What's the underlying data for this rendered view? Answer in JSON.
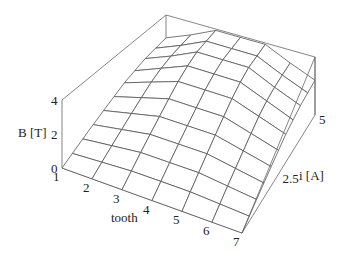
{
  "chart_data": {
    "type": "surface3d",
    "title": "",
    "xlabel": "tooth",
    "ylabel": "i [A]",
    "zlabel": "B [T]",
    "x_ticks": [
      "1",
      "2",
      "3",
      "4",
      "5",
      "6",
      "7"
    ],
    "y_ticks": [
      "2.5",
      "5"
    ],
    "z_ticks": [
      "0",
      "2",
      "4"
    ],
    "xlim": [
      1,
      7
    ],
    "ylim": [
      0,
      5
    ],
    "zlim": [
      0,
      4
    ],
    "x": [
      1,
      2,
      3,
      4,
      5,
      6,
      7
    ],
    "y": [
      0,
      0.5,
      1,
      1.5,
      2,
      2.5,
      3,
      3.5,
      4,
      4.5,
      5
    ],
    "z": [
      [
        0.0,
        0.3,
        0.6,
        0.9,
        1.2,
        1.5,
        1.8,
        2.0,
        2.2,
        2.3,
        2.4
      ],
      [
        0.0,
        0.4,
        0.8,
        1.2,
        1.6,
        2.0,
        2.4,
        2.7,
        2.9,
        3.0,
        3.1
      ],
      [
        0.0,
        0.5,
        1.0,
        1.5,
        2.0,
        2.5,
        3.0,
        3.4,
        3.7,
        3.8,
        3.9
      ],
      [
        0.0,
        0.5,
        1.0,
        1.5,
        2.0,
        2.5,
        3.0,
        3.4,
        3.7,
        3.8,
        3.9
      ],
      [
        0.0,
        0.5,
        1.0,
        1.5,
        2.0,
        2.5,
        3.0,
        3.4,
        3.7,
        3.8,
        3.9
      ],
      [
        0.0,
        0.4,
        0.8,
        1.2,
        1.6,
        2.0,
        2.4,
        2.7,
        2.9,
        3.0,
        3.1
      ],
      [
        0.0,
        0.3,
        0.6,
        0.9,
        1.2,
        1.5,
        1.8,
        2.0,
        2.2,
        2.3,
        2.4
      ]
    ],
    "box": true,
    "grid": false,
    "legend": null
  },
  "labels": {
    "z_axis": "B [T]",
    "x_axis": "tooth",
    "y_axis": "i [A]"
  }
}
